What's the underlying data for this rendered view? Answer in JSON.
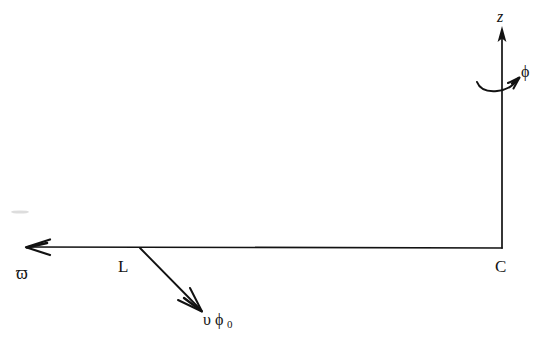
{
  "figure": {
    "background_color": "#ffffff",
    "ink_color": "#121212"
  },
  "labels": {
    "z_axis": "z",
    "phi_rotation": "ϕ",
    "radial_axis": "ϖ",
    "point_L": "L",
    "point_C": "C",
    "velocity_symbol": "υ",
    "velocity_sub_phi": "ϕ",
    "velocity_sub_zero": "0"
  },
  "geometry": {
    "z_axis": {
      "x": 502,
      "y_top": 28,
      "y_bottom": 248,
      "arrow": "solid-up"
    },
    "radial_axis": {
      "y": 248,
      "x_right": 502,
      "x_left_tip": 25,
      "arrow": "open-left"
    },
    "velocity_vector": {
      "x_start": 140,
      "y_start": 248,
      "x_end": 202,
      "y_end": 311,
      "arrow": "open-down-right"
    },
    "phi_arc": {
      "cx": 500,
      "cy": 86,
      "rx": 23,
      "ry": 7,
      "arrow": "open-up-right"
    }
  },
  "label_positions": {
    "z": {
      "x": 497,
      "y": 22
    },
    "phi": {
      "x": 521,
      "y": 77
    },
    "varpi": {
      "x": 16,
      "y": 278
    },
    "L": {
      "x": 118,
      "y": 272
    },
    "C": {
      "x": 495,
      "y": 272
    },
    "velocity": {
      "x": 203,
      "y": 325
    }
  }
}
